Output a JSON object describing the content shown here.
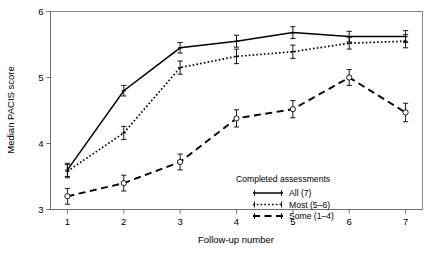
{
  "chart_data": {
    "type": "line",
    "title": "",
    "xlabel": "Follow-up number",
    "ylabel": "Median PACIS score",
    "x": [
      1,
      2,
      3,
      4,
      5,
      6,
      7
    ],
    "xlim": [
      0.7,
      7.3
    ],
    "ylim": [
      3,
      6
    ],
    "xticks": [
      "1",
      "2",
      "3",
      "4",
      "5",
      "6",
      "7"
    ],
    "yticks": [
      "3",
      "4",
      "5",
      "6"
    ],
    "grid": false,
    "legend_position": "inside-lower-right",
    "legend_title": "Completed assessments",
    "series": [
      {
        "name": "All (7)",
        "linestyle": "solid",
        "marker": "errorbar-cross",
        "color": "#000000",
        "values": [
          3.6,
          4.8,
          5.45,
          5.55,
          5.68,
          5.62,
          5.62
        ],
        "errors": [
          0.1,
          0.08,
          0.08,
          0.09,
          0.09,
          0.08,
          0.09
        ]
      },
      {
        "name": "Most (5–6)",
        "linestyle": "dotted",
        "marker": "errorbar-cross",
        "color": "#000000",
        "values": [
          3.58,
          4.16,
          5.15,
          5.32,
          5.39,
          5.52,
          5.55
        ],
        "errors": [
          0.1,
          0.1,
          0.1,
          0.11,
          0.1,
          0.09,
          0.1
        ]
      },
      {
        "name": "Some (1–4)",
        "linestyle": "dashed",
        "marker": "errorbar-circle",
        "color": "#000000",
        "values": [
          3.2,
          3.4,
          3.72,
          4.38,
          4.52,
          5.0,
          4.47
        ],
        "errors": [
          0.12,
          0.12,
          0.12,
          0.13,
          0.13,
          0.12,
          0.14
        ]
      }
    ]
  },
  "axes": {
    "y_title": "Median PACIS score",
    "x_title": "Follow-up number",
    "y_tick_labels": [
      "6",
      "5",
      "4",
      "3"
    ],
    "x_tick_labels": [
      "1",
      "2",
      "3",
      "4",
      "5",
      "6",
      "7"
    ]
  },
  "legend": {
    "title": "Completed assessments",
    "entries": [
      {
        "label": "All (7)",
        "style": "solid"
      },
      {
        "label": "Most (5–6)",
        "style": "dotted"
      },
      {
        "label": "Some (1–4)",
        "style": "dashed"
      }
    ]
  }
}
